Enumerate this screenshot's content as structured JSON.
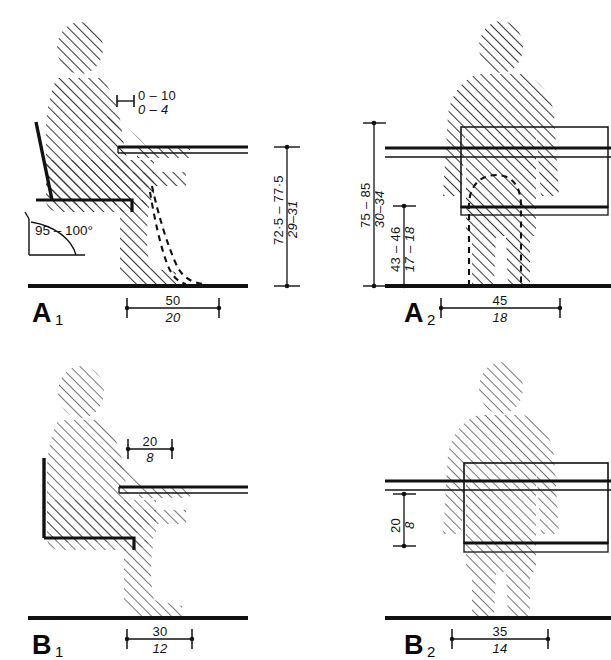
{
  "figure": {
    "background_color": "#ffffff",
    "line_color": "#111111",
    "hatch_color": "#3a3a3a",
    "units_note": "upper value centimetres, lower italic value inches"
  },
  "panels": {
    "a1": {
      "label_letter": "A",
      "label_sub": "1",
      "name": "seated-side-view-upper",
      "dimensions": {
        "desk_clearance": {
          "metric": "0 – 10",
          "imperial": "0 – 4",
          "name": "desk-edge-clearance"
        },
        "desk_height": {
          "metric": "72·5 – 77·5",
          "imperial": "29–31",
          "name": "desk-height"
        },
        "seat_angle": {
          "value": "95 – 100°",
          "name": "backrest-angle"
        },
        "leg_depth": {
          "metric": "50",
          "imperial": "20",
          "name": "knee-clearance-depth"
        }
      }
    },
    "a2": {
      "label_letter": "A",
      "label_sub": "2",
      "name": "standing-front-view-upper",
      "dimensions": {
        "desk_height": {
          "metric": "75 – 85",
          "imperial": "30–34",
          "name": "desk-height"
        },
        "under_desk_height": {
          "metric": "43 – 46",
          "imperial": "17 – 18",
          "name": "under-desk-clearance-height"
        },
        "knee_width": {
          "metric": "45",
          "imperial": "18",
          "name": "knee-clearance-width"
        }
      }
    },
    "b1": {
      "label_letter": "B",
      "label_sub": "1",
      "name": "seated-side-view-lower",
      "dimensions": {
        "desk_overhang": {
          "metric": "20",
          "imperial": "8",
          "name": "desk-overhang-depth"
        },
        "foot_depth": {
          "metric": "30",
          "imperial": "12",
          "name": "foot-clearance-depth"
        }
      }
    },
    "b2": {
      "label_letter": "B",
      "label_sub": "2",
      "name": "standing-front-view-lower",
      "dimensions": {
        "drawer_height": {
          "metric": "20",
          "imperial": "8",
          "name": "drawer-box-height"
        },
        "box_width": {
          "metric": "35",
          "imperial": "14",
          "name": "box-width"
        }
      }
    }
  }
}
